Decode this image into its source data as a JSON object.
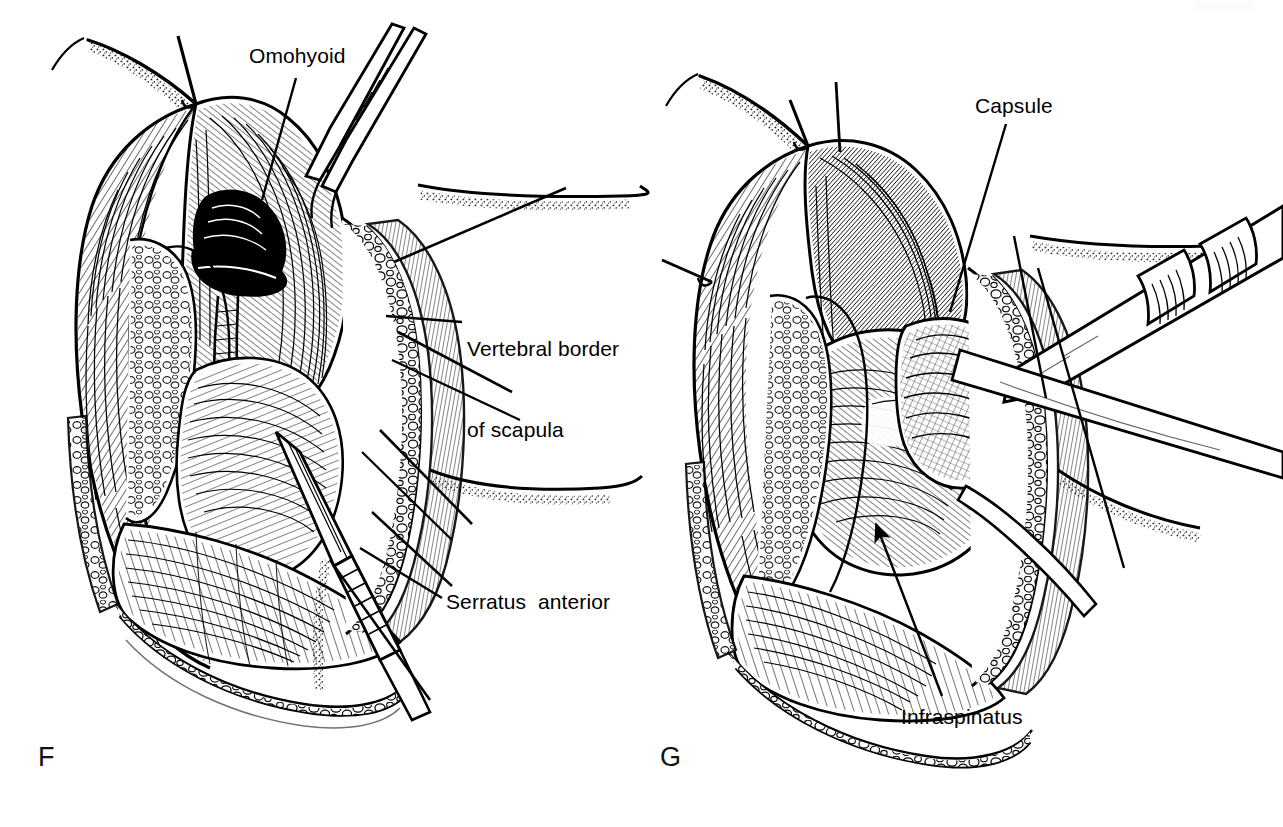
{
  "figure": {
    "type": "surgical-anatomy-line-illustration",
    "style": "black-and-white pen-and-ink hatched medical illustration",
    "background_color": "#ffffff",
    "ink_color": "#000000",
    "width": 1283,
    "height": 827,
    "panels": [
      {
        "id": "F",
        "letter": "F",
        "position": "left",
        "description": "Posterior scapular surgical exposure with skin flaps retracted, trapezius reflected, omohyoid and serratus anterior exposed, vertebral border of scapula visible, retractors and dissecting instrument in field",
        "labels": [
          "Omohyoid",
          "Vertebral border of scapula",
          "Serratus anterior"
        ]
      },
      {
        "id": "G",
        "letter": "G",
        "position": "right",
        "description": "Deeper exposure of the shoulder joint with infraspinatus reflected and joint capsule exposed, retractor instrument entering from upper right",
        "labels": [
          "Capsule",
          "Infraspinatus"
        ]
      }
    ]
  },
  "annotations": {
    "omohyoid": {
      "text": "Omohyoid",
      "panel": "F",
      "leader": "line descending left from label to omohyoid muscle belly"
    },
    "vertebral_border": {
      "line1": "Vertebral border",
      "line2": "of scapula",
      "panel": "F",
      "leader": "line extending left from label to vertebral border of scapula"
    },
    "serratus_anterior": {
      "text": "Serratus  anterior",
      "panel": "F",
      "leader": "two lines extending up-left from label to serratus anterior muscle"
    },
    "capsule": {
      "text": "Capsule",
      "panel": "G",
      "leader": "line descending from label to shoulder joint capsule"
    },
    "infraspinatus": {
      "text": "Infraspinatus",
      "panel": "G",
      "leader": "arrow pointing up-left from label to infraspinatus muscle"
    }
  },
  "panel_letters": {
    "f": "F",
    "g": "G"
  }
}
